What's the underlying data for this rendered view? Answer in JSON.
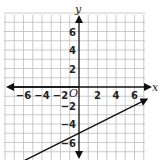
{
  "chart_data": {
    "type": "line",
    "title": "",
    "xlabel": "x",
    "ylabel": "y",
    "origin_label": "O",
    "xlim": [
      -8,
      8
    ],
    "ylim": [
      -8,
      8
    ],
    "grid": true,
    "x_ticks": [
      "-6",
      "-4",
      "-2",
      "2",
      "4",
      "6"
    ],
    "y_ticks": [
      "6",
      "4",
      "2",
      "-2",
      "-4",
      "-6"
    ],
    "series": [
      {
        "name": "line",
        "equation": "y = 0.5x - 5",
        "x": [
          -6,
          0,
          6
        ],
        "y": [
          -8,
          -5,
          -2
        ],
        "arrows": "both"
      }
    ]
  }
}
